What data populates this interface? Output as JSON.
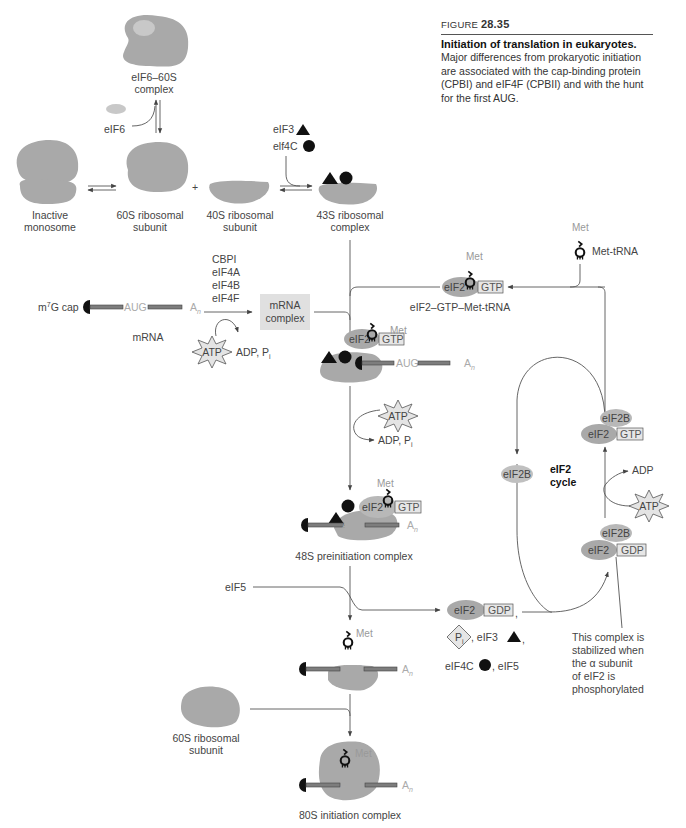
{
  "caption": {
    "figure_prefix": "FIGURE ",
    "figure_number": "28.35",
    "title": "Initiation of translation in eukaryotes.",
    "body": "Major differences from prokaryotic initiation are associated with the cap-binding protein (CPBI) and eIF4F (CPBII) and with the hunt for the first AUG."
  },
  "top_row": {
    "eif6_60s_line1": "eIF6–60S",
    "eif6_60s_line2": "complex",
    "eif6": "eIF6",
    "inactive_line1": "Inactive",
    "inactive_line2": "monosome",
    "s60_line1": "60S ribosomal",
    "s60_line2": "subunit",
    "plus": "+",
    "s40_line1": "40S ribosomal",
    "s40_line2": "subunit",
    "eif3": "eIF3",
    "eif4c": "elf4C",
    "s43_line1": "43S ribosomal",
    "s43_line2": "complex"
  },
  "mrna_step": {
    "cap_m": "m",
    "cap_sup": "7",
    "cap_rest": "G cap",
    "aug": "AUG",
    "an": "A",
    "an_sub": "n",
    "mrna": "mRNA",
    "factors": [
      "CBPI",
      "eIF4A",
      "eIF4B",
      "eIF4F"
    ],
    "atp": "ATP",
    "adp_pi": "ADP, P",
    "pi_sub": "i",
    "complex_line1": "mRNA",
    "complex_line2": "complex"
  },
  "ternary": {
    "met": "Met",
    "eif2": "eIF2",
    "gtp": "GTP",
    "label": "eIF2–GTP–Met-tRNA",
    "met_trna": "Met-tRNA"
  },
  "scan_step": {
    "met": "Met",
    "eif2": "eIF2",
    "gtp": "GTP",
    "aug": "AUG",
    "an": "A",
    "an_sub": "n",
    "atp": "ATP",
    "adp_pi": "ADP, P",
    "pi_sub": "i"
  },
  "preinit_48s": {
    "met": "Met",
    "eif2": "eIF2",
    "gtp": "GTP",
    "aug": "AUG",
    "an": "A",
    "an_sub": "n",
    "label": "48S preinitiation complex"
  },
  "eif5_step": {
    "eif5": "eIF5",
    "met": "Met",
    "aug": "AUG",
    "an": "A",
    "an_sub": "n",
    "released_eif2": "eIF2",
    "released_gdp": "GDP",
    "pi": "P",
    "pi_sub": "i",
    "eif3": ", eIF3",
    "eif4c": "eIF4C",
    "eif5b": ", eIF5",
    "comma": ","
  },
  "cycle": {
    "eif2b": "eIF2B",
    "title_line1": "eIF2",
    "title_line2": "cycle",
    "top_eif2b": "eIF2B",
    "top_eif2": "eIF2",
    "top_gtp": "GTP",
    "adp": "ADP",
    "atp": "ATP",
    "bot_eif2b": "eIF2B",
    "bot_eif2": "eIF2",
    "bot_gdp": "GDP",
    "note": [
      "This complex is",
      "stabilized when",
      "the α subunit",
      "of eIF2 is",
      "phosphorylated"
    ]
  },
  "final": {
    "s60_line1": "60S ribosomal",
    "s60_line2": "subunit",
    "met": "Met",
    "aug": "AUG",
    "an": "A",
    "an_sub": "n",
    "label": "80S initiation complex"
  },
  "colors": {
    "ribosome": "#a9a9a9",
    "factor_light": "#c8c8c8",
    "mrna_bar": "#7d7d7d",
    "box_fill": "#e6e6e6",
    "text": "#444444"
  }
}
